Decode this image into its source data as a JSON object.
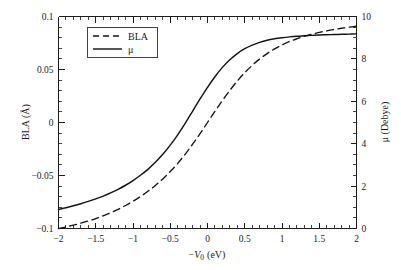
{
  "figure": {
    "background_color": "#ffffff",
    "line_color": "#141414",
    "width": 401,
    "height": 270
  },
  "chart_data": {
    "type": "line",
    "title": "",
    "subtitle": "",
    "xlabel": "−V₀ (eV)",
    "xlabel_parts": {
      "minus": "−",
      "symbol": "V",
      "subscript": "0",
      "units": "(eV)"
    },
    "ylabel": "BLA (Å)",
    "ylabel_right": "μ (Debye)",
    "xlim": [
      -2,
      2
    ],
    "ylim": [
      -0.1,
      0.1
    ],
    "ylim_right": [
      0,
      10
    ],
    "xticks": [
      -2,
      -1.5,
      -1,
      -0.5,
      0,
      0.5,
      1,
      1.5,
      2
    ],
    "xtick_labels": [
      "−2",
      "−1.5",
      "−1",
      "−0.5",
      "0",
      "0.5",
      "1",
      "1.5",
      "2"
    ],
    "yticks": [
      -0.1,
      -0.05,
      0,
      0.05,
      0.1
    ],
    "ytick_labels": [
      "−0.1",
      "−0.05",
      "0",
      "0.05",
      "0.1"
    ],
    "yticks_right": [
      0,
      2,
      4,
      6,
      8,
      10
    ],
    "ytick_labels_right": [
      "0",
      "2",
      "4",
      "6",
      "8",
      "10"
    ],
    "x_minor_step": 0.1,
    "y_minor_step": 0.01,
    "y_minor_step_right": 0.5,
    "grid": false,
    "legend_position": "upper left",
    "series": [
      {
        "name": "BLA",
        "axis": "left",
        "style": "dashed",
        "x": [
          -2,
          -1.9,
          -1.8,
          -1.7,
          -1.6,
          -1.5,
          -1.4,
          -1.3,
          -1.2,
          -1.1,
          -1,
          -0.9,
          -0.8,
          -0.7,
          -0.6,
          -0.5,
          -0.4,
          -0.3,
          -0.2,
          -0.1,
          0,
          0.1,
          0.2,
          0.3,
          0.4,
          0.5,
          0.6,
          0.7,
          0.8,
          0.9,
          1,
          1.1,
          1.2,
          1.3,
          1.4,
          1.5,
          1.6,
          1.7,
          1.8,
          1.9,
          2
        ],
        "values": [
          -0.1,
          -0.0985,
          -0.0968,
          -0.095,
          -0.0929,
          -0.0906,
          -0.088,
          -0.0851,
          -0.0819,
          -0.0783,
          -0.0743,
          -0.0699,
          -0.0649,
          -0.0594,
          -0.0532,
          -0.0463,
          -0.0386,
          -0.03,
          -0.0205,
          -0.0105,
          0,
          0.0105,
          0.0207,
          0.0303,
          0.0391,
          0.047,
          0.0539,
          0.0599,
          0.065,
          0.0694,
          0.0731,
          0.0763,
          0.079,
          0.0813,
          0.0833,
          0.085,
          0.0865,
          0.0878,
          0.0889,
          0.0899,
          0.0908
        ]
      },
      {
        "name": "μ",
        "axis": "right",
        "style": "solid",
        "x": [
          -2,
          -1.9,
          -1.8,
          -1.7,
          -1.6,
          -1.5,
          -1.4,
          -1.3,
          -1.2,
          -1.1,
          -1,
          -0.9,
          -0.8,
          -0.7,
          -0.6,
          -0.5,
          -0.4,
          -0.3,
          -0.2,
          -0.1,
          0,
          0.1,
          0.2,
          0.3,
          0.4,
          0.5,
          0.6,
          0.7,
          0.8,
          0.9,
          1,
          1.1,
          1.2,
          1.3,
          1.4,
          1.5,
          1.6,
          1.7,
          1.8,
          1.9,
          2
        ],
        "values": [
          0.9,
          0.98,
          1.07,
          1.17,
          1.28,
          1.4,
          1.53,
          1.68,
          1.85,
          2.04,
          2.26,
          2.51,
          2.79,
          3.12,
          3.5,
          3.93,
          4.42,
          4.96,
          5.53,
          6.11,
          6.66,
          7.16,
          7.6,
          7.96,
          8.25,
          8.48,
          8.65,
          8.78,
          8.88,
          8.95,
          9.0,
          9.04,
          9.07,
          9.09,
          9.11,
          9.13,
          9.14,
          9.15,
          9.16,
          9.17,
          9.18
        ]
      }
    ],
    "legend": [
      {
        "label": "BLA",
        "style": "dashed"
      },
      {
        "label": "μ",
        "style": "solid"
      }
    ]
  }
}
